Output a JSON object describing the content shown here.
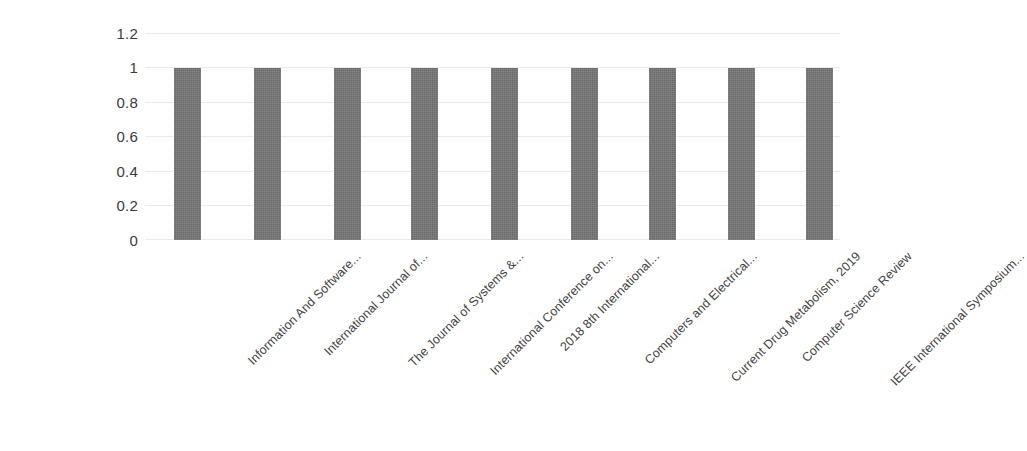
{
  "chart_data": {
    "type": "bar",
    "title": "",
    "subtitle": "",
    "xlabel": "",
    "ylabel": "",
    "ylim": [
      0,
      1.2
    ],
    "yticks": [
      "0",
      "0.2",
      "0.4",
      "0.6",
      "0.8",
      "1",
      "1.2"
    ],
    "ytick_values": [
      0,
      0.2,
      0.4,
      0.6,
      0.8,
      1,
      1.2
    ],
    "grid": true,
    "grid_axis": "y",
    "legend": false,
    "legend_position": "none",
    "xtick_rotation": -45,
    "categories": [
      "Information And Software...",
      "International Journal of...",
      "The Journal of Systems &...",
      "International Conference on...",
      "2018 8th International...",
      "Computers and Electrical...",
      "Current Drug Metabolism, 2019",
      "Computer Science Review",
      "IEEE International Symposium..."
    ],
    "values": [
      1,
      1,
      1,
      1,
      1,
      1,
      1,
      1,
      1
    ],
    "series": [
      {
        "name": "Count",
        "values": [
          1,
          1,
          1,
          1,
          1,
          1,
          1,
          1,
          1
        ]
      }
    ]
  },
  "style": {
    "bar_color": "#757575",
    "grid_color": "#e9e9e9",
    "tick_label_color": "#3b3b3b",
    "category_label_color": "#434343",
    "background": "#ffffff"
  }
}
